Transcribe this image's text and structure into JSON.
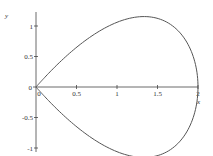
{
  "chart_data": {
    "type": "line",
    "title": "",
    "xlabel": "x",
    "ylabel": "y",
    "xlim": [
      -0.05,
      2.0
    ],
    "ylim": [
      -1.1,
      1.1
    ],
    "grid": false,
    "legend": null,
    "x_ticks": [
      {
        "value": 0,
        "label": "0"
      },
      {
        "value": 0.5,
        "label": "0.5"
      },
      {
        "value": 1,
        "label": "1"
      },
      {
        "value": 1.5,
        "label": "1.5"
      },
      {
        "value": 2,
        "label": "2"
      }
    ],
    "y_ticks": [
      {
        "value": 1,
        "label": "1"
      },
      {
        "value": 0.5,
        "label": "0.5"
      },
      {
        "value": 0,
        "label": "0"
      },
      {
        "value": -0.5,
        "label": "-0.5"
      },
      {
        "value": -1,
        "label": "-1"
      }
    ],
    "series": [
      {
        "name": "closed teardrop curve",
        "description": "Closed curve starting at origin cusp, upper lobe peaking at y≈1.05 near x≈1, lower lobe reaching y≈-1.05, meeting at x=2 on the x-axis",
        "x": [
          0,
          0.1,
          0.25,
          0.5,
          0.75,
          1.0,
          1.25,
          1.5,
          1.75,
          1.95,
          2.0,
          1.95,
          1.75,
          1.5,
          1.25,
          1.0,
          0.75,
          0.5,
          0.25,
          0.1,
          0
        ],
        "y": [
          0,
          0.15,
          0.34,
          0.71,
          0.93,
          1.06,
          1.05,
          0.87,
          0.57,
          0.19,
          0,
          -0.19,
          -0.57,
          -0.87,
          -1.05,
          -1.06,
          -0.93,
          -0.71,
          -0.34,
          -0.15,
          0
        ]
      },
      {
        "name": "x-axis segment",
        "x": [
          0,
          2
        ],
        "y": [
          0,
          0
        ]
      }
    ],
    "colors": {
      "curve": "#555555",
      "axes": "#444444"
    }
  }
}
